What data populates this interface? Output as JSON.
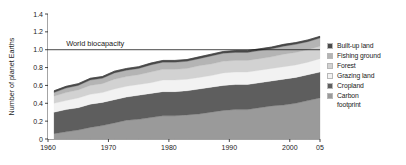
{
  "chart_data": {
    "type": "area",
    "title": "",
    "subtitle": "",
    "xlabel": "",
    "ylabel": "Number of planet Earths",
    "xlim": [
      1960,
      2005
    ],
    "ylim": [
      0,
      1.4
    ],
    "grid": false,
    "legend_position": "right",
    "stacked": true,
    "x_tick_labels": [
      "1960",
      "1970",
      "1980",
      "1990",
      "2000",
      "05"
    ],
    "x_tick_values": [
      1960,
      1970,
      1980,
      1990,
      2000,
      2005
    ],
    "y_tick_labels": [
      "0",
      "0.2",
      "0.4",
      "0.6",
      "0.8",
      "1.0",
      "1.2",
      "1.4"
    ],
    "y_tick_values": [
      0,
      0.2,
      0.4,
      0.6,
      0.8,
      1.0,
      1.2,
      1.4
    ],
    "annotations": [
      {
        "text": "World biocapacity",
        "type": "horizontal-line-label",
        "y_value": 1.0,
        "x_value": 1963
      }
    ],
    "x": [
      1961,
      1963,
      1965,
      1967,
      1969,
      1971,
      1973,
      1975,
      1977,
      1979,
      1981,
      1983,
      1985,
      1987,
      1989,
      1991,
      1993,
      1995,
      1997,
      1999,
      2001,
      2003,
      2005
    ],
    "series": [
      {
        "name": "Carbon footprint",
        "color": "#9a9a9a",
        "values": [
          0.06,
          0.08,
          0.1,
          0.13,
          0.15,
          0.18,
          0.21,
          0.22,
          0.24,
          0.26,
          0.26,
          0.27,
          0.28,
          0.3,
          0.32,
          0.33,
          0.33,
          0.35,
          0.37,
          0.38,
          0.4,
          0.43,
          0.46
        ]
      },
      {
        "name": "Cropland",
        "color": "#5e5e5e",
        "values": [
          0.24,
          0.25,
          0.25,
          0.26,
          0.26,
          0.26,
          0.26,
          0.27,
          0.27,
          0.27,
          0.27,
          0.27,
          0.28,
          0.28,
          0.28,
          0.28,
          0.28,
          0.28,
          0.28,
          0.29,
          0.29,
          0.29,
          0.29
        ]
      },
      {
        "name": "Grazing land",
        "color": "#f2f2f2",
        "values": [
          0.1,
          0.1,
          0.11,
          0.11,
          0.11,
          0.12,
          0.12,
          0.12,
          0.12,
          0.13,
          0.13,
          0.13,
          0.13,
          0.13,
          0.14,
          0.14,
          0.14,
          0.14,
          0.14,
          0.14,
          0.14,
          0.14,
          0.15
        ]
      },
      {
        "name": "Forest",
        "color": "#d2d2d2",
        "values": [
          0.08,
          0.09,
          0.09,
          0.1,
          0.1,
          0.11,
          0.11,
          0.11,
          0.12,
          0.12,
          0.12,
          0.12,
          0.13,
          0.13,
          0.13,
          0.13,
          0.13,
          0.13,
          0.13,
          0.14,
          0.14,
          0.14,
          0.14
        ]
      },
      {
        "name": "Fishing ground",
        "color": "#b4b4b4",
        "values": [
          0.04,
          0.05,
          0.05,
          0.06,
          0.06,
          0.07,
          0.07,
          0.07,
          0.08,
          0.08,
          0.08,
          0.08,
          0.08,
          0.09,
          0.09,
          0.09,
          0.09,
          0.09,
          0.09,
          0.09,
          0.09,
          0.09,
          0.09
        ]
      },
      {
        "name": "Built-up land",
        "color": "#4a4a4a",
        "values": [
          0.02,
          0.02,
          0.02,
          0.02,
          0.02,
          0.02,
          0.02,
          0.02,
          0.02,
          0.02,
          0.02,
          0.02,
          0.02,
          0.02,
          0.02,
          0.02,
          0.02,
          0.02,
          0.02,
          0.02,
          0.02,
          0.02,
          0.02
        ]
      }
    ],
    "totals": [
      0.54,
      0.59,
      0.62,
      0.68,
      0.7,
      0.76,
      0.79,
      0.81,
      0.85,
      0.88,
      0.88,
      0.89,
      0.92,
      0.95,
      0.98,
      0.99,
      0.99,
      1.01,
      1.03,
      1.06,
      1.08,
      1.11,
      1.15
    ]
  },
  "legend": {
    "items": [
      {
        "label": "Built-up land",
        "color": "#4a4a4a"
      },
      {
        "label": "Fishing ground",
        "color": "#b4b4b4"
      },
      {
        "label": "Forest",
        "color": "#d2d2d2"
      },
      {
        "label": "Grazing land",
        "color": "#f2f2f2"
      },
      {
        "label": "Cropland",
        "color": "#5e5e5e"
      },
      {
        "label": "Carbon\nfootprint",
        "color": "#9a9a9a"
      }
    ]
  },
  "axes": {
    "y_title": "Number of planet Earths"
  }
}
